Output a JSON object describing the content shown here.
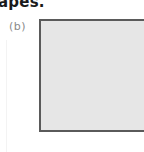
{
  "page": {
    "heading_fragment": "apes.",
    "figure": {
      "part_label": "(b)",
      "shape": {
        "type": "square",
        "fill_color": "#e6e6e6",
        "border_color": "#5a5a5a"
      }
    }
  }
}
